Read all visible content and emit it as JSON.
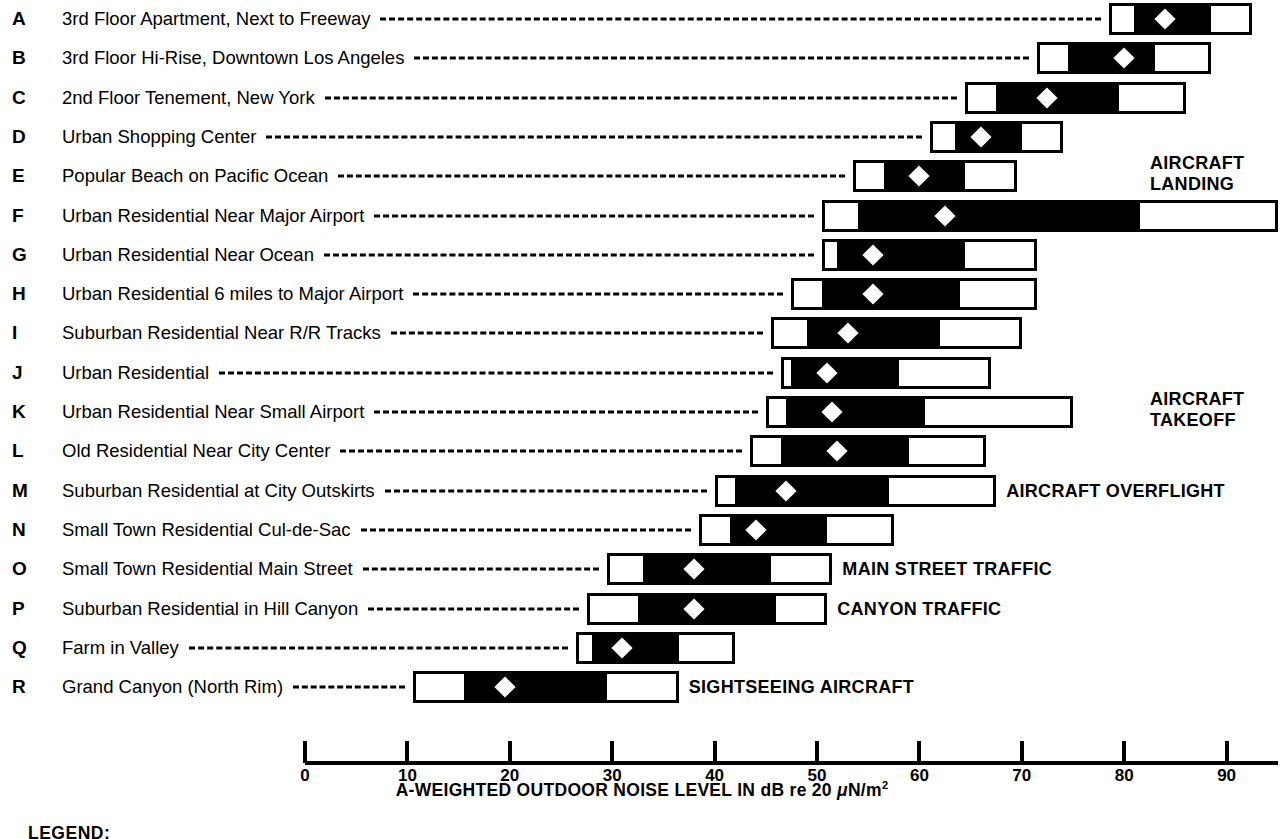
{
  "chart_data": {
    "type": "bar",
    "title": "",
    "subtitle": "",
    "xlabel": "A-WEIGHTED OUTDOOR NOISE LEVEL IN dB re 20 μN/m²",
    "ylabel": "",
    "xlim": [
      0,
      95
    ],
    "xticks": [
      0,
      10,
      20,
      30,
      40,
      50,
      60,
      70,
      80,
      90
    ],
    "xticklabels": [
      "0",
      "10",
      "20",
      "30",
      "40",
      "50",
      "60",
      "70",
      "80",
      "90"
    ],
    "grid": false,
    "legend_position": "bottom-left",
    "note": "Each row is a floating range bar: outer white box = full (min–max) range, inner black box = typical range, white diamond = median level.",
    "categories": [
      "3rd Floor Apartment, Next to Freeway",
      "3rd Floor Hi-Rise, Downtown Los Angeles",
      "2nd Floor Tenement, New York",
      "Urban Shopping Center",
      "Popular Beach on Pacific Ocean",
      "Urban Residential Near Major Airport",
      "Urban Residential Near Ocean",
      "Urban Residential 6 miles to Major Airport",
      "Suburban Residential Near R/R Tracks",
      "Urban Residential",
      "Urban Residential Near Small Airport",
      "Old Residential Near City Center",
      "Suburban Residential at City Outskirts",
      "Small Town Residential Cul-de-Sac",
      "Small Town Residential Main Street",
      "Suburban Residential in Hill Canyon",
      "Farm in Valley",
      "Grand Canyon (North Rim)"
    ],
    "rows": [
      {
        "letter": "A",
        "label": "3rd Floor Apartment, Next to Freeway",
        "outer_min": 78.5,
        "outer_max": 92.5,
        "inner_min": 81.0,
        "inner_max": 88.5,
        "median": 84.0,
        "annotation": ""
      },
      {
        "letter": "B",
        "label": "3rd Floor Hi-Rise, Downtown Los Angeles",
        "outer_min": 71.5,
        "outer_max": 88.5,
        "inner_min": 74.5,
        "inner_max": 83.0,
        "median": 80.0,
        "annotation": ""
      },
      {
        "letter": "C",
        "label": "2nd Floor Tenement, New York",
        "outer_min": 64.5,
        "outer_max": 86.0,
        "inner_min": 67.5,
        "inner_max": 79.5,
        "median": 72.5,
        "annotation": ""
      },
      {
        "letter": "D",
        "label": "Urban Shopping Center",
        "outer_min": 61.0,
        "outer_max": 74.0,
        "inner_min": 63.5,
        "inner_max": 70.0,
        "median": 66.0,
        "annotation": ""
      },
      {
        "letter": "E",
        "label": "Popular Beach on Pacific Ocean",
        "outer_min": 53.5,
        "outer_max": 69.5,
        "inner_min": 56.5,
        "inner_max": 64.5,
        "median": 60.0,
        "annotation": "AIRCRAFT\nLANDING"
      },
      {
        "letter": "F",
        "label": "Urban Residential Near Major Airport",
        "outer_min": 50.5,
        "outer_max": 95.0,
        "inner_min": 54.0,
        "inner_max": 81.5,
        "median": 62.5,
        "annotation": ""
      },
      {
        "letter": "G",
        "label": "Urban Residential Near Ocean",
        "outer_min": 50.5,
        "outer_max": 71.5,
        "inner_min": 52.0,
        "inner_max": 64.5,
        "median": 55.5,
        "annotation": ""
      },
      {
        "letter": "H",
        "label": "Urban Residential 6 miles to Major Airport",
        "outer_min": 47.5,
        "outer_max": 71.5,
        "inner_min": 50.5,
        "inner_max": 64.0,
        "median": 55.5,
        "annotation": ""
      },
      {
        "letter": "I",
        "label": "Suburban Residential Near R/R Tracks",
        "outer_min": 45.5,
        "outer_max": 70.0,
        "inner_min": 49.0,
        "inner_max": 62.0,
        "median": 53.0,
        "annotation": ""
      },
      {
        "letter": "J",
        "label": "Urban Residential",
        "outer_min": 46.5,
        "outer_max": 67.0,
        "inner_min": 47.5,
        "inner_max": 58.0,
        "median": 51.0,
        "annotation": ""
      },
      {
        "letter": "K",
        "label": "Urban Residential Near Small Airport",
        "outer_min": 45.0,
        "outer_max": 75.0,
        "inner_min": 47.0,
        "inner_max": 60.5,
        "median": 51.5,
        "annotation": "AIRCRAFT\nTAKEOFF"
      },
      {
        "letter": "L",
        "label": "Old Residential Near City Center",
        "outer_min": 43.5,
        "outer_max": 66.5,
        "inner_min": 46.5,
        "inner_max": 59.0,
        "median": 52.0,
        "annotation": ""
      },
      {
        "letter": "M",
        "label": "Suburban Residential at City Outskirts",
        "outer_min": 40.0,
        "outer_max": 67.5,
        "inner_min": 42.0,
        "inner_max": 57.0,
        "median": 47.0,
        "annotation": "AIRCRAFT OVERFLIGHT"
      },
      {
        "letter": "N",
        "label": "Small Town Residential Cul-de-Sac",
        "outer_min": 38.5,
        "outer_max": 57.5,
        "inner_min": 41.5,
        "inner_max": 51.0,
        "median": 44.0,
        "annotation": ""
      },
      {
        "letter": "O",
        "label": "Small Town Residential Main Street",
        "outer_min": 29.5,
        "outer_max": 51.5,
        "inner_min": 33.0,
        "inner_max": 45.5,
        "median": 38.0,
        "annotation": "MAIN STREET TRAFFIC"
      },
      {
        "letter": "P",
        "label": "Suburban Residential in Hill Canyon",
        "outer_min": 27.5,
        "outer_max": 51.0,
        "inner_min": 32.5,
        "inner_max": 46.0,
        "median": 38.0,
        "annotation": "CANYON TRAFFIC"
      },
      {
        "letter": "Q",
        "label": "Farm in Valley",
        "outer_min": 26.5,
        "outer_max": 42.0,
        "inner_min": 28.0,
        "inner_max": 36.5,
        "median": 31.0,
        "annotation": ""
      },
      {
        "letter": "R",
        "label": "Grand Canyon (North Rim)",
        "outer_min": 10.5,
        "outer_max": 36.5,
        "inner_min": 15.5,
        "inner_max": 29.5,
        "median": 19.5,
        "annotation": "SIGHTSEEING AIRCRAFT"
      }
    ]
  },
  "axis": {
    "title": "A-WEIGHTED OUTDOOR NOISE LEVEL IN dB re 20 ",
    "title_mu": "μ",
    "title_tail": "N/m",
    "title_sup": "2",
    "ticks": [
      "0",
      "10",
      "20",
      "30",
      "40",
      "50",
      "60",
      "70",
      "80",
      "90"
    ]
  },
  "legend": {
    "title": "LEGEND:"
  },
  "colors": {
    "ink": "#000000",
    "paper": "#ffffff"
  }
}
